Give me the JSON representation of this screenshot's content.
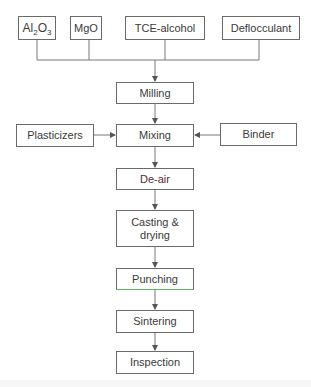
{
  "inputs": [
    {
      "label_main": "Al",
      "sub1": "2",
      "mid": "O",
      "sub2": "3",
      "text": "Al2O3"
    },
    {
      "text": "MgO"
    },
    {
      "text": "TCE-alcohol"
    },
    {
      "text": "Deflocculant"
    }
  ],
  "side_inputs": {
    "left": "Plasticizers",
    "right": "Binder"
  },
  "steps": [
    "Milling",
    "Mixing",
    "De-air",
    "Casting &\ndrying",
    "Punching",
    "Sintering",
    "Inspection"
  ],
  "steps_labels": {
    "milling": "Milling",
    "mixing": "Mixing",
    "deair": "De-air",
    "casting_line1": "Casting &",
    "casting_line2": "drying",
    "punching": "Punching",
    "sintering": "Sintering",
    "inspection": "Inspection"
  },
  "colors": {
    "border": "#6a6a6a",
    "text": "#3a3a3a",
    "punching_bottom_border": "#5cb85c",
    "deair_text": "#5a2a2e"
  }
}
